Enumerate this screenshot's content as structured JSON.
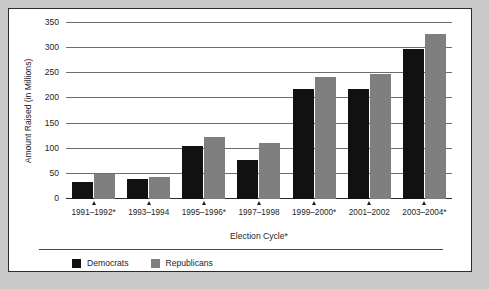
{
  "chart_data": {
    "type": "bar",
    "title": "",
    "xlabel": "Election Cycle*",
    "ylabel": "Amount Raised (in Millions)",
    "categories": [
      "1991–1992*",
      "1993–1994",
      "1995–1996*",
      "1997–1998",
      "1999–2000*",
      "2001–2002",
      "2003–2004*"
    ],
    "series": [
      {
        "name": "Democrats",
        "color": "#111111",
        "values": [
          34,
          40,
          106,
          77,
          218,
          219,
          298
        ]
      },
      {
        "name": "Republicans",
        "color": "#7f7f7f",
        "values": [
          50,
          44,
          124,
          111,
          243,
          249,
          328
        ]
      }
    ],
    "ylim": [
      0,
      350
    ],
    "yticks": [
      0,
      50,
      100,
      150,
      200,
      250,
      300,
      350
    ],
    "ytick_labels": [
      "0",
      "50",
      "100",
      "150",
      "200",
      "250",
      "300",
      "350"
    ],
    "grid": true,
    "legend_position": "bottom-left"
  },
  "legend": {
    "items": [
      {
        "label": "Democrats",
        "swatch": "dem"
      },
      {
        "label": "Republicans",
        "swatch": "rep"
      }
    ]
  }
}
